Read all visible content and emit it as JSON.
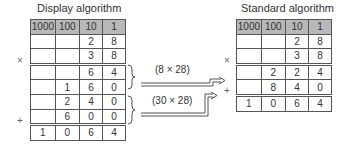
{
  "display": {
    "title": "Display algorithm",
    "headers": [
      "1000",
      "100",
      "10",
      "1"
    ],
    "rows": [
      [
        "",
        "",
        "2",
        "8"
      ],
      [
        "",
        "",
        "3",
        "8"
      ],
      [
        "",
        "",
        "6",
        "4"
      ],
      [
        "",
        "1",
        "6",
        "0"
      ],
      [
        "",
        "2",
        "4",
        "0"
      ],
      [
        "",
        "6",
        "0",
        "0"
      ],
      [
        "1",
        "0",
        "6",
        "4"
      ]
    ],
    "times_sign": "×",
    "plus_sign": "+"
  },
  "standard": {
    "title": "Standard algorithm",
    "headers": [
      "1000",
      "100",
      "10",
      "1"
    ],
    "rows": [
      [
        "",
        "",
        "2",
        "8"
      ],
      [
        "",
        "",
        "3",
        "8"
      ],
      [
        "",
        "2",
        "2",
        "4"
      ],
      [
        "",
        "8",
        "4",
        "0"
      ],
      [
        "1",
        "0",
        "6",
        "4"
      ]
    ],
    "times_sign": "×",
    "plus_sign": "+"
  },
  "arrows": [
    {
      "label": "(8 × 28)"
    },
    {
      "label": "(30 × 28)"
    }
  ]
}
